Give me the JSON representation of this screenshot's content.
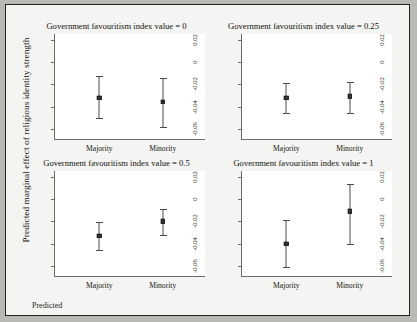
{
  "figure": {
    "y_axis_title": "Predicted marginal effect of religious identity strength",
    "footer_label": "Predicted"
  },
  "chart_data": {
    "type": "scatter",
    "subtype": "error-bar point-range, 2x2 facet grid",
    "title": "",
    "xlabel": "",
    "ylabel": "Predicted marginal effect of religious identity strength",
    "ylim": [
      -0.07,
      0.025
    ],
    "yticks": [
      0.02,
      0,
      -0.02,
      -0.04,
      -0.06
    ],
    "ytick_labels": [
      "0.02",
      "0",
      "-0.02",
      "-0.04",
      "-0.06"
    ],
    "categories": [
      "Majority",
      "Minority"
    ],
    "grid": false,
    "legend": "none",
    "facet_variable": "Government favouritism index value",
    "panels": [
      {
        "title": "Government favouritism index value = 0",
        "facet_value": "0",
        "points": [
          {
            "category": "Majority",
            "estimate": -0.032,
            "ci_low": -0.05,
            "ci_high": -0.013
          },
          {
            "category": "Minority",
            "estimate": -0.036,
            "ci_low": -0.058,
            "ci_high": -0.014
          }
        ]
      },
      {
        "title": "Government favouritism index value = 0.25",
        "facet_value": "0.25",
        "points": [
          {
            "category": "Majority",
            "estimate": -0.032,
            "ci_low": -0.046,
            "ci_high": -0.019
          },
          {
            "category": "Minority",
            "estimate": -0.031,
            "ci_low": -0.046,
            "ci_high": -0.018
          }
        ]
      },
      {
        "title": "Government favouritism index value = 0.5",
        "facet_value": "0.5",
        "points": [
          {
            "category": "Majority",
            "estimate": -0.033,
            "ci_low": -0.046,
            "ci_high": -0.021
          },
          {
            "category": "Minority",
            "estimate": -0.02,
            "ci_low": -0.032,
            "ci_high": -0.009
          }
        ]
      },
      {
        "title": "Government favouritism index value = 1",
        "facet_value": "1",
        "points": [
          {
            "category": "Majority",
            "estimate": -0.04,
            "ci_low": -0.061,
            "ci_high": -0.019
          },
          {
            "category": "Minority",
            "estimate": -0.011,
            "ci_low": -0.04,
            "ci_high": 0.013
          }
        ]
      }
    ],
    "colors": {
      "point": "#3a3a37",
      "errorbar": "#4a4a46",
      "axis": "#6d6d68",
      "panel_background": "#ffffff",
      "figure_background": "#f4f4f2",
      "frame": "#23231f"
    }
  }
}
